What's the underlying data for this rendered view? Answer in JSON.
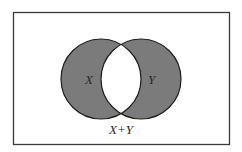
{
  "diagram": {
    "type": "venn",
    "sets": [
      {
        "label": "X",
        "shaded": true
      },
      {
        "label": "Y",
        "shaded": true
      }
    ],
    "intersection": {
      "shaded": false
    },
    "caption": "X+Y",
    "colors": {
      "shade": "#7b7b7b",
      "stroke": "#1e1e1e",
      "frame": "#3a3a3a",
      "background": "#ffffff"
    }
  }
}
